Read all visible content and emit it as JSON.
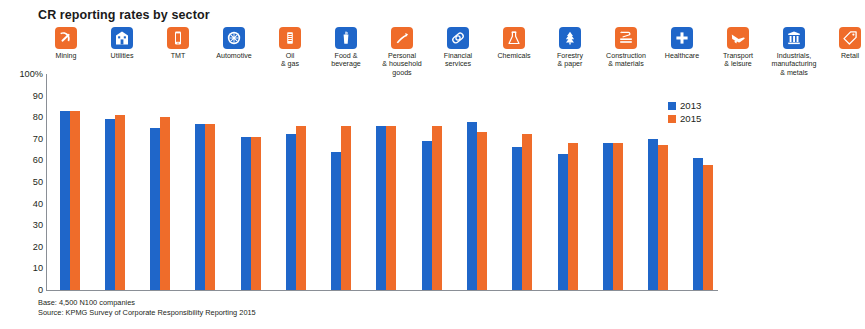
{
  "chart_data": {
    "type": "bar",
    "title": "CR reporting rates by sector",
    "xlabel": "",
    "ylabel": "",
    "ylim": [
      0,
      100
    ],
    "grid": false,
    "legend_position": "right",
    "y_ticks": [
      "100%",
      "90",
      "80",
      "70",
      "60",
      "50",
      "40",
      "30",
      "20",
      "10",
      "0"
    ],
    "y_tick_values": [
      100,
      90,
      80,
      70,
      60,
      50,
      40,
      30,
      20,
      10,
      0
    ],
    "categories": [
      "Mining",
      "Utilities",
      "TMT",
      "Automotive",
      "Oil\n& gas",
      "Food &\nbeverage",
      "Personal\n& household\ngoods",
      "Financial\nservices",
      "Chemicals",
      "Forestry\n& paper",
      "Construction\n& materials",
      "Healthcare",
      "Transport\n& leisure",
      "Industrials,\nmanufacturing\n& metals",
      "Retail"
    ],
    "series": [
      {
        "name": "2013",
        "color": "#1f66c9",
        "values": [
          83,
          79,
          75,
          77,
          71,
          72,
          64,
          76,
          69,
          78,
          66,
          63,
          68,
          70,
          61
        ]
      },
      {
        "name": "2015",
        "color": "#ef6c2a",
        "values": [
          83,
          81,
          80,
          77,
          71,
          76,
          76,
          76,
          76,
          73,
          72,
          68,
          68,
          67,
          58
        ]
      }
    ],
    "icons": [
      {
        "name": "mining-icon",
        "color": "#ef6c2a"
      },
      {
        "name": "utilities-icon",
        "color": "#1f66c9"
      },
      {
        "name": "tmt-icon",
        "color": "#ef6c2a"
      },
      {
        "name": "automotive-icon",
        "color": "#1f66c9"
      },
      {
        "name": "oil-and-gas-icon",
        "color": "#ef6c2a"
      },
      {
        "name": "food-and-beverage-icon",
        "color": "#1f66c9"
      },
      {
        "name": "personal-and-household-goods-icon",
        "color": "#ef6c2a"
      },
      {
        "name": "financial-services-icon",
        "color": "#1f66c9"
      },
      {
        "name": "chemicals-icon",
        "color": "#ef6c2a"
      },
      {
        "name": "forestry-and-paper-icon",
        "color": "#1f66c9"
      },
      {
        "name": "construction-and-materials-icon",
        "color": "#ef6c2a"
      },
      {
        "name": "healthcare-icon",
        "color": "#1f66c9"
      },
      {
        "name": "transport-and-leisure-icon",
        "color": "#ef6c2a"
      },
      {
        "name": "industrials-manufacturing-and-metals-icon",
        "color": "#1f66c9"
      },
      {
        "name": "retail-icon",
        "color": "#ef6c2a"
      }
    ]
  },
  "footer": {
    "base": "Base: 4,500 N100 companies",
    "source": "Source: KPMG Survey of Corporate Responsibility Reporting 2015"
  },
  "colors": {
    "series_2013": "#1f66c9",
    "series_2015": "#ef6c2a",
    "axis": "#8a8f96",
    "text": "#231f20",
    "background": "#ffffff"
  }
}
